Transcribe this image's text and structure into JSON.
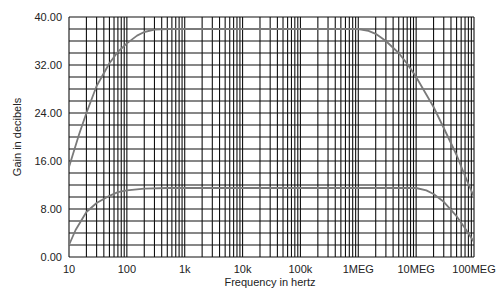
{
  "chart_data": {
    "type": "line",
    "title": "",
    "xlabel": "Frequency in hertz",
    "ylabel": "Gain in decibels",
    "xscale": "log",
    "xlim": [
      10,
      100000000
    ],
    "ylim": [
      0,
      40
    ],
    "grid": true,
    "legend": null,
    "x_tick_labels": [
      "10",
      "100",
      "1k",
      "10k",
      "100k",
      "1MEG",
      "10MEG",
      "100MEG"
    ],
    "x_tick_values": [
      10,
      100,
      1000,
      10000,
      100000,
      1000000,
      10000000,
      100000000
    ],
    "y_tick_labels": [
      "0.00",
      "8.00",
      "16.00",
      "24.00",
      "32.00",
      "40.00"
    ],
    "y_tick_values": [
      0,
      8,
      16,
      24,
      32,
      40
    ],
    "series": [
      {
        "name": "high-gain response",
        "color": "#7a7a7a",
        "points": [
          [
            10,
            15
          ],
          [
            15,
            20.5
          ],
          [
            20,
            24
          ],
          [
            30,
            28.5
          ],
          [
            50,
            32.3
          ],
          [
            70,
            34.2
          ],
          [
            100,
            35.6
          ],
          [
            150,
            36.9
          ],
          [
            200,
            37.5
          ],
          [
            300,
            37.9
          ],
          [
            500,
            38
          ],
          [
            1000,
            38
          ],
          [
            10000,
            38
          ],
          [
            100000,
            38
          ],
          [
            1000000,
            38
          ],
          [
            1500000,
            37.7
          ],
          [
            2000000,
            37.2
          ],
          [
            3000000,
            36
          ],
          [
            5000000,
            34
          ],
          [
            7000000,
            32.2
          ],
          [
            10000000,
            30
          ],
          [
            20000000,
            25
          ],
          [
            30000000,
            21.5
          ],
          [
            50000000,
            17
          ],
          [
            70000000,
            13.5
          ],
          [
            100000000,
            10
          ]
        ]
      },
      {
        "name": "low-gain response",
        "color": "#7a7a7a",
        "points": [
          [
            10,
            2
          ],
          [
            13,
            4.5
          ],
          [
            20,
            7.5
          ],
          [
            30,
            9
          ],
          [
            50,
            10.2
          ],
          [
            70,
            10.8
          ],
          [
            100,
            11.1
          ],
          [
            200,
            11.4
          ],
          [
            500,
            11.5
          ],
          [
            1000,
            11.5
          ],
          [
            100000,
            11.5
          ],
          [
            1000000,
            11.5
          ],
          [
            10000000,
            11.5
          ],
          [
            15000000,
            11.1
          ],
          [
            20000000,
            10.5
          ],
          [
            30000000,
            9.2
          ],
          [
            50000000,
            6.8
          ],
          [
            70000000,
            4.8
          ],
          [
            100000000,
            2.5
          ]
        ]
      }
    ]
  },
  "colors": {
    "grid": "#111111",
    "curve": "#7a7a7a",
    "background": "#ffffff"
  }
}
